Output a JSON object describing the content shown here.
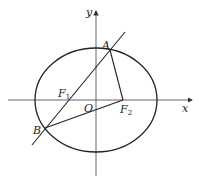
{
  "diagram": {
    "type": "ellipse-focal-triangle",
    "axes": {
      "x_label": "x",
      "y_label": "y",
      "origin_label": "O"
    },
    "points": {
      "A": {
        "label": "A"
      },
      "B": {
        "label": "B"
      },
      "F1": {
        "label": "F",
        "sub": "1"
      },
      "F2": {
        "label": "F",
        "sub": "2"
      }
    },
    "colors": {
      "stroke": "#222222",
      "axis": "#555555",
      "background": "#ffffff"
    }
  }
}
